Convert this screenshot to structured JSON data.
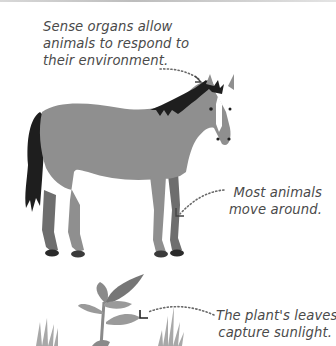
{
  "captions": {
    "sense_organs": {
      "lines": [
        "Sense organs allow",
        "animals to respond to",
        "their environment."
      ]
    },
    "movement": {
      "lines": [
        "Most animals",
        "move around."
      ]
    },
    "plant_leaves": {
      "lines": [
        "The plant's leaves",
        "capture sunlight."
      ]
    }
  },
  "illustrations": {
    "horse": "horse-illustration",
    "plant": "plant-seedling-illustration",
    "grass_left": "grass-tuft",
    "grass_right": "grass-tuft"
  },
  "colors": {
    "horse_body": "#8f8f8f",
    "horse_far_legs": "#6e6e6e",
    "mane_tail": "#1e1e1e",
    "blaze": "#ffffff",
    "plant_light": "#9a9a9a",
    "plant_dark": "#767676",
    "grass": "#a8a8a8",
    "text": "#4a4a4a",
    "leader_dots": "#6a6a6a"
  }
}
